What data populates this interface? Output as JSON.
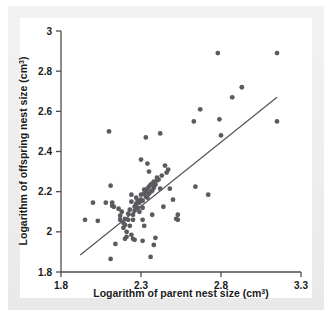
{
  "figure": {
    "background_color": "#ececec",
    "plot_background_color": "#ffffff",
    "axis_color": "#4a4a4a",
    "point_color": "#5a5a5f",
    "line_color": "#55555a",
    "point_radius": 2.4
  },
  "chart_data": {
    "type": "scatter",
    "title": "",
    "xlabel": "Logarithm of parent nest size (cm",
    "xlabel_sup": "3",
    "xlabel_suffix": ")",
    "ylabel": "Logarithm of offspring nest size (cm",
    "ylabel_sup": "3",
    "ylabel_suffix": ")",
    "xlim": [
      1.8,
      3.3
    ],
    "ylim": [
      1.8,
      3.0
    ],
    "xticks": [
      1.8,
      2.3,
      2.8,
      3.3
    ],
    "xtick_labels": [
      "1.8",
      "2.3",
      "2.8",
      "3.3"
    ],
    "yticks": [
      1.8,
      2.0,
      2.2,
      2.4,
      2.6,
      2.8,
      3.0
    ],
    "ytick_labels": [
      "1.8",
      "2",
      "2.2",
      "2.4",
      "2.6",
      "2.8",
      "3"
    ],
    "grid": false,
    "legend": null,
    "trendline": {
      "x": [
        1.92,
        3.15
      ],
      "y": [
        1.885,
        2.67
      ]
    },
    "points": [
      [
        1.95,
        2.06
      ],
      [
        2.0,
        2.145
      ],
      [
        2.03,
        2.055
      ],
      [
        2.08,
        2.145
      ],
      [
        2.1,
        2.5
      ],
      [
        2.11,
        2.23
      ],
      [
        2.12,
        2.13
      ],
      [
        2.13,
        2.125
      ],
      [
        2.12,
        2.145
      ],
      [
        2.11,
        1.865
      ],
      [
        2.14,
        1.94
      ],
      [
        2.16,
        2.115
      ],
      [
        2.17,
        2.08
      ],
      [
        2.17,
        2.06
      ],
      [
        2.18,
        2.1
      ],
      [
        2.19,
        2.045
      ],
      [
        2.19,
        2.02
      ],
      [
        2.2,
        2.065
      ],
      [
        2.2,
        2.035
      ],
      [
        2.21,
        2.0
      ],
      [
        2.21,
        1.975
      ],
      [
        2.2,
        1.965
      ],
      [
        2.22,
        2.06
      ],
      [
        2.22,
        2.09
      ],
      [
        2.23,
        2.03
      ],
      [
        2.23,
        2.11
      ],
      [
        2.24,
        2.15
      ],
      [
        2.24,
        2.185
      ],
      [
        2.25,
        2.06
      ],
      [
        2.25,
        2.085
      ],
      [
        2.26,
        2.125
      ],
      [
        2.26,
        2.105
      ],
      [
        2.24,
        1.985
      ],
      [
        2.25,
        1.965
      ],
      [
        2.26,
        1.96
      ],
      [
        2.27,
        2.14
      ],
      [
        2.27,
        2.17
      ],
      [
        2.28,
        2.12
      ],
      [
        2.28,
        2.155
      ],
      [
        2.29,
        2.1
      ],
      [
        2.29,
        2.145
      ],
      [
        2.3,
        2.16
      ],
      [
        2.3,
        2.185
      ],
      [
        2.31,
        2.12
      ],
      [
        2.31,
        2.155
      ],
      [
        2.32,
        2.19
      ],
      [
        2.32,
        2.21
      ],
      [
        2.3,
        2.36
      ],
      [
        2.31,
        2.06
      ],
      [
        2.32,
        2.03
      ],
      [
        2.31,
        1.955
      ],
      [
        2.33,
        2.175
      ],
      [
        2.33,
        2.2
      ],
      [
        2.34,
        2.17
      ],
      [
        2.34,
        2.215
      ],
      [
        2.35,
        2.19
      ],
      [
        2.35,
        2.225
      ],
      [
        2.36,
        2.2
      ],
      [
        2.36,
        2.235
      ],
      [
        2.33,
        2.47
      ],
      [
        2.34,
        2.34
      ],
      [
        2.35,
        2.3
      ],
      [
        2.36,
        1.875
      ],
      [
        2.37,
        2.205
      ],
      [
        2.37,
        2.24
      ],
      [
        2.38,
        2.22
      ],
      [
        2.38,
        2.25
      ],
      [
        2.39,
        2.235
      ],
      [
        2.37,
        2.085
      ],
      [
        2.38,
        1.935
      ],
      [
        2.39,
        1.97
      ],
      [
        2.4,
        2.255
      ],
      [
        2.4,
        2.27
      ],
      [
        2.41,
        2.26
      ],
      [
        2.42,
        2.49
      ],
      [
        2.42,
        2.215
      ],
      [
        2.43,
        2.28
      ],
      [
        2.44,
        2.125
      ],
      [
        2.45,
        2.33
      ],
      [
        2.46,
        2.295
      ],
      [
        2.47,
        2.31
      ],
      [
        2.48,
        2.215
      ],
      [
        2.5,
        2.16
      ],
      [
        2.52,
        2.065
      ],
      [
        2.53,
        2.06
      ],
      [
        2.53,
        2.085
      ],
      [
        2.63,
        2.55
      ],
      [
        2.64,
        2.225
      ],
      [
        2.67,
        2.61
      ],
      [
        2.72,
        2.185
      ],
      [
        2.78,
        2.89
      ],
      [
        2.79,
        2.56
      ],
      [
        2.8,
        2.48
      ],
      [
        2.87,
        2.67
      ],
      [
        2.93,
        2.72
      ],
      [
        3.15,
        2.89
      ],
      [
        3.15,
        2.55
      ]
    ]
  }
}
